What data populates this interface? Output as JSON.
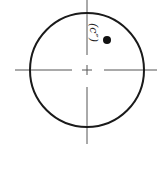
{
  "diagram": {
    "type": "circle-with-centerlines",
    "label": "(c″)",
    "colors": {
      "circle": "#1a1a1a",
      "centerline": "#555555",
      "dot": "#111111",
      "background": "#ffffff"
    },
    "circle": {
      "cx": 87,
      "cy": 70,
      "r": 57
    },
    "dot": {
      "cx": 107,
      "cy": 40,
      "r": 4
    }
  }
}
